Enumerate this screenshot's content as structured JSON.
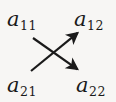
{
  "figure": {
    "background_color": "#f7f6f4",
    "ink_color": "#1a1a1a",
    "width": 116,
    "height": 102
  },
  "terms": {
    "top_left": {
      "base": "a",
      "subscript": "11",
      "full": "a11"
    },
    "top_right": {
      "base": "a",
      "subscript": "12",
      "full": "a12"
    },
    "bottom_left": {
      "base": "a",
      "subscript": "21",
      "full": "a21"
    },
    "bottom_right": {
      "base": "a",
      "subscript": "22",
      "full": "a22"
    }
  },
  "arrows": [
    {
      "name": "arrow-a11-to-a22",
      "from": "a11",
      "to": "a22",
      "direction": "down-right",
      "x1": 33,
      "y1": 38,
      "x2": 80,
      "y2": 71,
      "stroke": "#1a1a1a",
      "stroke_width": 2.2
    },
    {
      "name": "arrow-a21-to-a12",
      "from": "a21",
      "to": "a12",
      "direction": "up-right",
      "x1": 31,
      "y1": 71,
      "x2": 80,
      "y2": 31,
      "stroke": "#1a1a1a",
      "stroke_width": 2.2
    }
  ],
  "crossing_point": {
    "x": 56,
    "y": 54
  }
}
